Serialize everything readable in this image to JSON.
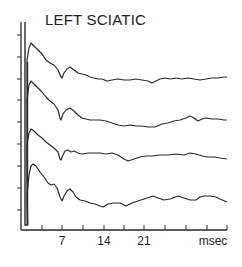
{
  "chart_data": {
    "type": "line",
    "title": "LEFT SCIATIC",
    "xlabel": "msec",
    "ylabel": "",
    "x_tick_labels": [
      "7",
      "14",
      "21"
    ],
    "x_tick_values": [
      7,
      14,
      21
    ],
    "x_tick_interval_ms": 3.5,
    "xlim": [
      0,
      35
    ],
    "grid": false,
    "legend": null,
    "series": [
      {
        "name": "Trace 1",
        "points_px": [
          [
            27,
            60
          ],
          [
            29,
            48
          ],
          [
            31,
            43
          ],
          [
            34,
            46
          ],
          [
            38,
            50
          ],
          [
            42,
            54
          ],
          [
            46,
            60
          ],
          [
            50,
            63
          ],
          [
            54,
            65
          ],
          [
            58,
            70
          ],
          [
            61,
            77
          ],
          [
            62,
            78
          ],
          [
            64,
            73
          ],
          [
            67,
            69
          ],
          [
            70,
            67
          ],
          [
            74,
            70
          ],
          [
            78,
            73
          ],
          [
            82,
            74
          ],
          [
            86,
            75
          ],
          [
            90,
            77
          ],
          [
            94,
            78
          ],
          [
            98,
            79
          ],
          [
            102,
            79
          ],
          [
            107,
            81
          ],
          [
            112,
            80
          ],
          [
            118,
            79
          ],
          [
            124,
            80
          ],
          [
            130,
            80
          ],
          [
            136,
            79
          ],
          [
            142,
            80
          ],
          [
            148,
            81
          ],
          [
            152,
            83
          ],
          [
            156,
            81
          ],
          [
            160,
            79
          ],
          [
            165,
            78
          ],
          [
            170,
            79
          ],
          [
            176,
            78
          ],
          [
            182,
            79
          ],
          [
            188,
            78
          ],
          [
            194,
            79
          ],
          [
            200,
            80
          ],
          [
            206,
            79
          ],
          [
            212,
            78
          ],
          [
            218,
            78
          ],
          [
            224,
            77
          ],
          [
            227,
            77
          ]
        ]
      },
      {
        "name": "Trace 2",
        "points_px": [
          [
            27,
            100
          ],
          [
            29,
            85
          ],
          [
            31,
            81
          ],
          [
            34,
            84
          ],
          [
            38,
            88
          ],
          [
            42,
            92
          ],
          [
            46,
            97
          ],
          [
            50,
            101
          ],
          [
            54,
            104
          ],
          [
            58,
            110
          ],
          [
            60,
            118
          ],
          [
            61,
            120
          ],
          [
            63,
            114
          ],
          [
            66,
            110
          ],
          [
            70,
            108
          ],
          [
            74,
            111
          ],
          [
            78,
            115
          ],
          [
            82,
            118
          ],
          [
            86,
            119
          ],
          [
            90,
            120
          ],
          [
            95,
            120
          ],
          [
            100,
            120
          ],
          [
            106,
            121
          ],
          [
            112,
            123
          ],
          [
            118,
            125
          ],
          [
            124,
            126
          ],
          [
            130,
            125
          ],
          [
            136,
            126
          ],
          [
            142,
            126
          ],
          [
            148,
            127
          ],
          [
            155,
            127
          ],
          [
            162,
            124
          ],
          [
            168,
            123
          ],
          [
            174,
            121
          ],
          [
            180,
            120
          ],
          [
            186,
            118
          ],
          [
            190,
            116
          ],
          [
            194,
            118
          ],
          [
            198,
            121
          ],
          [
            202,
            119
          ],
          [
            206,
            118
          ],
          [
            212,
            119
          ],
          [
            218,
            119
          ],
          [
            224,
            120
          ],
          [
            227,
            120
          ]
        ]
      },
      {
        "name": "Trace 3",
        "points_px": [
          [
            27,
            145
          ],
          [
            29,
            133
          ],
          [
            31,
            129
          ],
          [
            34,
            131
          ],
          [
            38,
            135
          ],
          [
            42,
            138
          ],
          [
            46,
            142
          ],
          [
            50,
            145
          ],
          [
            54,
            148
          ],
          [
            58,
            152
          ],
          [
            60,
            159
          ],
          [
            61,
            160
          ],
          [
            63,
            155
          ],
          [
            65,
            151
          ],
          [
            68,
            150
          ],
          [
            71,
            152
          ],
          [
            74,
            151
          ],
          [
            78,
            153
          ],
          [
            82,
            154
          ],
          [
            88,
            153
          ],
          [
            94,
            153
          ],
          [
            100,
            153
          ],
          [
            106,
            154
          ],
          [
            112,
            153
          ],
          [
            118,
            155
          ],
          [
            124,
            159
          ],
          [
            128,
            161
          ],
          [
            134,
            159
          ],
          [
            140,
            157
          ],
          [
            146,
            156
          ],
          [
            152,
            156
          ],
          [
            160,
            155
          ],
          [
            168,
            155
          ],
          [
            176,
            154
          ],
          [
            184,
            155
          ],
          [
            190,
            153
          ],
          [
            196,
            154
          ],
          [
            202,
            156
          ],
          [
            208,
            157
          ],
          [
            214,
            157
          ],
          [
            220,
            158
          ],
          [
            227,
            159
          ]
        ]
      },
      {
        "name": "Trace 4",
        "points_px": [
          [
            27,
            195
          ],
          [
            29,
            175
          ],
          [
            31,
            166
          ],
          [
            33,
            164
          ],
          [
            36,
            166
          ],
          [
            40,
            172
          ],
          [
            44,
            177
          ],
          [
            48,
            183
          ],
          [
            51,
            185
          ],
          [
            54,
            184
          ],
          [
            57,
            188
          ],
          [
            60,
            197
          ],
          [
            62,
            201
          ],
          [
            64,
            196
          ],
          [
            67,
            191
          ],
          [
            70,
            189
          ],
          [
            73,
            192
          ],
          [
            76,
            197
          ],
          [
            80,
            200
          ],
          [
            85,
            201
          ],
          [
            90,
            203
          ],
          [
            95,
            204
          ],
          [
            100,
            206
          ],
          [
            103,
            207
          ],
          [
            108,
            204
          ],
          [
            114,
            203
          ],
          [
            120,
            203
          ],
          [
            126,
            206
          ],
          [
            132,
            203
          ],
          [
            138,
            201
          ],
          [
            144,
            199
          ],
          [
            150,
            197
          ],
          [
            153,
            196
          ],
          [
            158,
            198
          ],
          [
            164,
            200
          ],
          [
            170,
            199
          ],
          [
            178,
            196
          ],
          [
            184,
            198
          ],
          [
            190,
            200
          ],
          [
            196,
            200
          ],
          [
            200,
            197
          ],
          [
            204,
            196
          ],
          [
            210,
            196
          ],
          [
            216,
            197
          ],
          [
            220,
            199
          ],
          [
            227,
            202
          ]
        ]
      }
    ],
    "stimulus_artifact": {
      "x_px": 26,
      "top_px": 22,
      "bottom_px": 225
    },
    "axes_px": {
      "x0": 21,
      "x1": 227,
      "y_axis_top": 22,
      "baseline": 230
    },
    "x_ticks_px": [
      42,
      62,
      83,
      104,
      124,
      144,
      165,
      186,
      207,
      227
    ],
    "y_ticks_px": [
      35,
      57,
      79,
      100,
      122,
      144,
      166,
      188,
      210
    ]
  },
  "colors": {
    "ink": "#2a2a2a",
    "background": "#ffffff"
  }
}
